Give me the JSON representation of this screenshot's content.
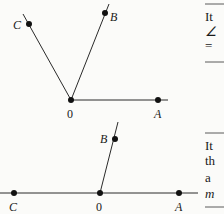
{
  "figures": [
    {
      "name": "figure-top",
      "vertex_label": "0",
      "points": [
        {
          "label": "A",
          "italic": true
        },
        {
          "label": "B",
          "italic": true
        },
        {
          "label": "C",
          "italic": true
        }
      ]
    },
    {
      "name": "figure-bottom",
      "vertex_label": "0",
      "points": [
        {
          "label": "A",
          "italic": true
        },
        {
          "label": "B",
          "italic": true
        },
        {
          "label": "C",
          "italic": true
        }
      ]
    }
  ],
  "side_text": {
    "top_lines": [
      "It",
      "∠",
      "="
    ],
    "bottom_lines": [
      "It",
      "th",
      "a",
      "m"
    ]
  }
}
